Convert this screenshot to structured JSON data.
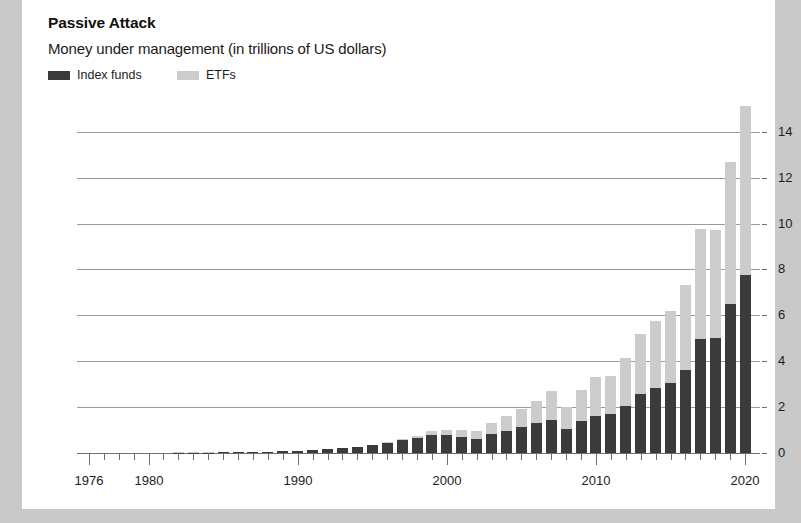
{
  "card": {
    "background": "#ffffff",
    "page_background": "#c9c9c9"
  },
  "header": {
    "title": "Passive Attack",
    "subtitle": "Money under management (in trillions of US dollars)"
  },
  "legend": {
    "position": "top-left",
    "items": [
      {
        "label": "Index funds",
        "color": "#3b3b3b",
        "x": 0
      },
      {
        "label": "ETFs",
        "color": "#cccccc",
        "x": 129
      }
    ]
  },
  "chart_data": {
    "type": "bar",
    "stacked": true,
    "title": "Passive Attack",
    "subtitle": "Money under management (in trillions of US dollars)",
    "xlabel": "",
    "ylabel": "",
    "ylim": [
      0,
      15.6
    ],
    "yticks": [
      0,
      2,
      4,
      6,
      8,
      10,
      12,
      14
    ],
    "ytick_labels": [
      "0",
      "2",
      "4",
      "6",
      "8",
      "10",
      "12",
      "14"
    ],
    "grid": true,
    "grid_axis": "y",
    "xlim": [
      1975.2,
      2021.0
    ],
    "xticks_every": 1,
    "xtick_labels": [
      {
        "year": 1976,
        "label": "1976"
      },
      {
        "year": 1980,
        "label": "1980"
      },
      {
        "year": 1990,
        "label": "1990"
      },
      {
        "year": 2000,
        "label": "2000"
      },
      {
        "year": 2010,
        "label": "2010"
      },
      {
        "year": 2020,
        "label": "2020"
      }
    ],
    "categories": [
      1976,
      1977,
      1978,
      1979,
      1980,
      1981,
      1982,
      1983,
      1984,
      1985,
      1986,
      1987,
      1988,
      1989,
      1990,
      1991,
      1992,
      1993,
      1994,
      1995,
      1996,
      1997,
      1998,
      1999,
      2000,
      2001,
      2002,
      2003,
      2004,
      2005,
      2006,
      2007,
      2008,
      2009,
      2010,
      2011,
      2012,
      2013,
      2014,
      2015,
      2016,
      2017,
      2018,
      2019,
      2020
    ],
    "series": [
      {
        "name": "Index funds",
        "color": "#3b3b3b",
        "values": [
          0.0,
          0.0,
          0.0,
          0.0,
          0.0,
          0.0,
          0.01,
          0.01,
          0.02,
          0.03,
          0.04,
          0.05,
          0.06,
          0.08,
          0.1,
          0.13,
          0.17,
          0.22,
          0.26,
          0.34,
          0.44,
          0.55,
          0.66,
          0.8,
          0.78,
          0.7,
          0.62,
          0.82,
          0.98,
          1.12,
          1.3,
          1.45,
          1.05,
          1.4,
          1.62,
          1.7,
          2.05,
          2.55,
          2.85,
          3.05,
          3.6,
          4.95,
          5.0,
          6.5,
          7.75
        ]
      },
      {
        "name": "ETFs",
        "color": "#cccccc",
        "values": [
          0.0,
          0.0,
          0.0,
          0.0,
          0.0,
          0.0,
          0.0,
          0.0,
          0.0,
          0.0,
          0.0,
          0.0,
          0.0,
          0.0,
          0.0,
          0.01,
          0.01,
          0.02,
          0.02,
          0.03,
          0.04,
          0.06,
          0.1,
          0.16,
          0.24,
          0.3,
          0.36,
          0.48,
          0.62,
          0.78,
          0.98,
          1.25,
          0.95,
          1.35,
          1.68,
          1.65,
          2.1,
          2.65,
          2.9,
          3.15,
          3.7,
          4.8,
          4.7,
          6.2,
          7.35
        ]
      }
    ],
    "totals": [
      0.0,
      0.0,
      0.0,
      0.0,
      0.0,
      0.0,
      0.01,
      0.01,
      0.02,
      0.03,
      0.04,
      0.05,
      0.06,
      0.08,
      0.1,
      0.14,
      0.18,
      0.24,
      0.28,
      0.37,
      0.48,
      0.61,
      0.76,
      0.96,
      1.02,
      1.0,
      0.98,
      1.3,
      1.6,
      1.9,
      2.28,
      2.7,
      2.0,
      2.75,
      3.3,
      3.35,
      4.15,
      5.2,
      5.75,
      6.2,
      7.3,
      9.75,
      9.7,
      12.7,
      15.1
    ]
  }
}
